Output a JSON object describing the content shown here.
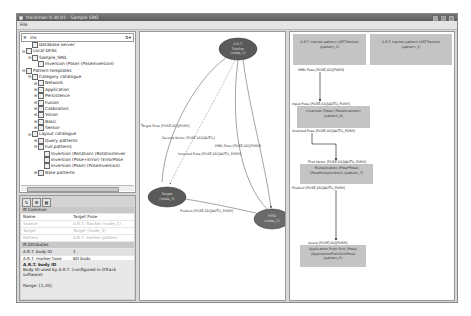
{
  "window": {
    "title": "trackman 0.30.01 - Sample SRG",
    "buttons": [
      "_",
      "□",
      "×"
    ]
  },
  "menu": {
    "items": [
      "File"
    ]
  },
  "tree": {
    "search_value": "inv",
    "items": [
      {
        "label": "Database server",
        "indent": 1,
        "exp": ""
      },
      {
        "label": "Local DFGs",
        "indent": 0,
        "exp": "⊟"
      },
      {
        "label": "Sample_SRG",
        "indent": 1,
        "exp": "⊟"
      },
      {
        "label": "Inversion (Pose) (PoseInversion)",
        "indent": 2,
        "exp": ""
      },
      {
        "label": "Pattern templates",
        "indent": 0,
        "exp": "⊟"
      },
      {
        "label": "Category catalogue",
        "indent": 1,
        "exp": "⊟"
      },
      {
        "label": "Network",
        "indent": 2,
        "exp": "⊞"
      },
      {
        "label": "Application",
        "indent": 2,
        "exp": "⊞"
      },
      {
        "label": "Persistence",
        "indent": 2,
        "exp": "⊞"
      },
      {
        "label": "Fusion",
        "indent": 2,
        "exp": "⊞"
      },
      {
        "label": "Calibration",
        "indent": 2,
        "exp": "⊞"
      },
      {
        "label": "Vision",
        "indent": 2,
        "exp": "⊞"
      },
      {
        "label": "Basic",
        "indent": 2,
        "exp": "⊞"
      },
      {
        "label": "Sensor",
        "indent": 2,
        "exp": "⊞"
      },
      {
        "label": "Layout catalogue",
        "indent": 1,
        "exp": "⊟"
      },
      {
        "label": "Query patterns",
        "indent": 2,
        "exp": "⊞"
      },
      {
        "label": "Full patterns",
        "indent": 2,
        "exp": "⊟"
      },
      {
        "label": "Inversion (Rotation) (RotationInver",
        "indent": 3,
        "exp": ""
      },
      {
        "label": "Inversion (Pose+Error) (ErrorPose",
        "indent": 3,
        "exp": ""
      },
      {
        "label": "Inversion (Pose) (PoseInversion)",
        "indent": 3,
        "exp": ""
      },
      {
        "label": "Base patterns",
        "indent": 2,
        "exp": "⊞"
      }
    ]
  },
  "properties": {
    "toolbar": [
      "sort-icon",
      "category-icon",
      "grid-icon"
    ],
    "rows": [
      {
        "k": "⊟ Common",
        "v": "",
        "type": "cat"
      },
      {
        "k": "Name",
        "v": "Target Pose",
        "type": ""
      },
      {
        "k": "Source",
        "v": "A.R.T. Tracker (node_1)",
        "type": "dim"
      },
      {
        "k": "Target",
        "v": "Target (node_3)",
        "type": "dim"
      },
      {
        "k": "Pattern",
        "v": "A.R.T. marker pattern",
        "type": "dim"
      },
      {
        "k": "⊟ Attributes",
        "v": "",
        "type": "cat"
      },
      {
        "k": "A.R.T. body ID",
        "v": "1",
        "type": "sel"
      },
      {
        "k": "A.R.T. marker type",
        "v": "6D body",
        "type": ""
      }
    ],
    "desc_title": "A.R.T. body ID",
    "desc_text": "Body ID used by A.R.T. (configured in DTrack software)",
    "desc_range": "Range: [1,20]"
  },
  "graph": {
    "nodes": [
      {
        "id": "art",
        "label1": "A.R.T.",
        "label2": "Tracker",
        "label3": "(node_1)"
      },
      {
        "id": "target",
        "label1": "Target",
        "label2": "(node_3)"
      },
      {
        "id": "hmd",
        "label1": "HMD",
        "label2": "(node_2)"
      }
    ],
    "edges": [
      "Target Pose  [POSE,6D][PUSH]",
      "Second factor  [POSE,6D][AUTO]",
      "HMD Pose  [POSE,6D][PUSH]",
      "Inverted Pose  [POSE,6D][AUTO_PUSH]",
      "Product  [POSE,6D][AUTO_PUSH]"
    ]
  },
  "pattern": {
    "top_boxes": [
      "A.R.T. tracker pattern (ARTTracker) (pattern_2)",
      "A.R.T. tracker pattern (ARTTracker) (pattern_1)"
    ],
    "labels": {
      "hmd_pose": "HMD Pose  [POSE,6D][PUSH]",
      "input_pose": "Input Pose  [POSE,6D][AUTO_PUSH]",
      "inverted_pose": "Inverted Pose  [POSE,6D][AUTO_PUSH]",
      "first_factor": "First factor  [POSE,6D][AUTO_PUSH]",
      "product": "Product  [POSE,6D][AUTO_PUSH]",
      "query": "Query  [POSE,6D][PUSH]"
    },
    "inversion_box": "Inversion (Pose) (PoseInversion) (pattern_0)",
    "mult_box": "Multiplication (Pose*Pose) (PoseMultiplication) (pattern_7)",
    "sink_box": "Application Push Sink (Pose) (ApplicationPushSinkPose) (pattern_5)"
  }
}
